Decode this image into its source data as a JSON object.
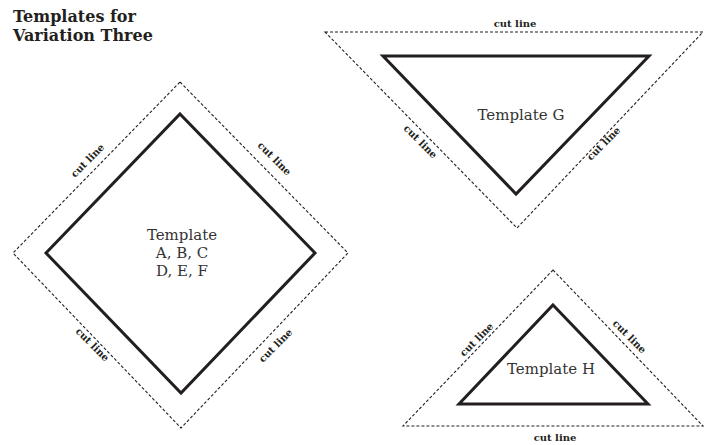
{
  "title": {
    "line1": "Templates for",
    "line2": "Variation Three"
  },
  "colors": {
    "ink": "#231f20",
    "background": "#ffffff"
  },
  "cut_line_label": "cut line",
  "templates": [
    {
      "id": "diamond",
      "shape": "square-on-point",
      "label_lines": [
        "Template",
        "A, B, C",
        "D, E, F"
      ],
      "cut_labels": [
        "cut line",
        "cut line",
        "cut line",
        "cut line"
      ]
    },
    {
      "id": "g",
      "shape": "inverted-triangle",
      "label_lines": [
        "Template G"
      ],
      "cut_labels": [
        "cut line",
        "cut line",
        "cut line"
      ]
    },
    {
      "id": "h",
      "shape": "triangle",
      "label_lines": [
        "Template H"
      ],
      "cut_labels": [
        "cut line",
        "cut line",
        "cut line"
      ]
    }
  ]
}
